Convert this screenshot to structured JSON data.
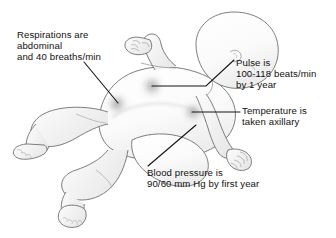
{
  "illustration": {
    "title": "Infant vital signs assessment diagram",
    "subject": "infant-lying-supine",
    "background_color": "#ffffff",
    "outline_color": "#6b6b6b",
    "body_fill": "#fbfbfb",
    "shade_color": "#d9d9d9",
    "marker_color": "#9a9a9a",
    "leader_line_color": "#1a1a1a",
    "text_color": "#111111"
  },
  "callouts": [
    {
      "id": "respirations",
      "name": "respirations-callout",
      "lines": [
        "Respirations are",
        "abdominal",
        "and 40 breaths/min"
      ],
      "target": "abdomen",
      "leader": "diagonal-down-right"
    },
    {
      "id": "pulse",
      "name": "pulse-callout",
      "lines": [
        "Pulse is",
        "100-118 beats/min",
        "by 1 year"
      ],
      "target": "chest",
      "leader": "diagonal-then-horizontal-left"
    },
    {
      "id": "temperature",
      "name": "temperature-callout",
      "lines": [
        "Temperature is",
        "taken axillary"
      ],
      "target": "axilla",
      "leader": "horizontal-left"
    },
    {
      "id": "bloodpressure",
      "name": "blood-pressure-callout",
      "lines": [
        "Blood pressure is",
        "90/60 mm Hg by first year"
      ],
      "target": "upper-arm",
      "leader": "diagonal-up-right"
    }
  ],
  "markers": [
    {
      "name": "chest-pulse-marker",
      "cx": 152,
      "cy": 86
    },
    {
      "name": "abdomen-respiration-marker",
      "cx": 117,
      "cy": 104
    },
    {
      "name": "axilla-temperature-marker",
      "cx": 193,
      "cy": 112
    }
  ]
}
